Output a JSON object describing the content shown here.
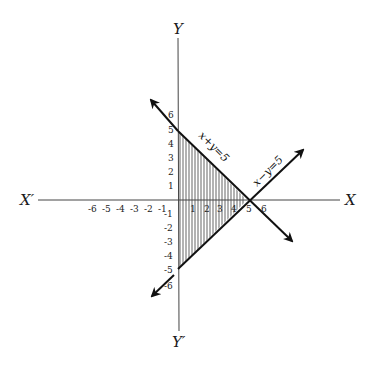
{
  "figure": {
    "axes": {
      "x_pos_label": "X",
      "x_neg_label": "X′",
      "y_pos_label": "Y",
      "y_neg_label": "Y′"
    },
    "x_ticks_pos": [
      "1",
      "2",
      "3",
      "4",
      "5",
      "6"
    ],
    "x_ticks_neg": [
      "-6",
      "-5",
      "-4",
      "-3",
      "-2",
      "-1"
    ],
    "y_ticks_pos": [
      "1",
      "2",
      "3",
      "4",
      "5",
      "6"
    ],
    "y_ticks_neg": [
      "-1",
      "-2",
      "-3",
      "-4",
      "-5",
      "-6"
    ],
    "lines": [
      {
        "equation": "x+y=5",
        "points": [
          [
            0,
            5
          ],
          [
            5,
            0
          ]
        ]
      },
      {
        "equation": "x−y=5",
        "points": [
          [
            0,
            -5
          ],
          [
            5,
            0
          ]
        ]
      }
    ],
    "shaded_region": {
      "vertices": [
        [
          0,
          5
        ],
        [
          5,
          0
        ],
        [
          0,
          -5
        ]
      ],
      "pattern": "vertical hatching"
    },
    "colors": {
      "ink": "#111111",
      "axis": "#444444",
      "background": "#ffffff"
    }
  }
}
